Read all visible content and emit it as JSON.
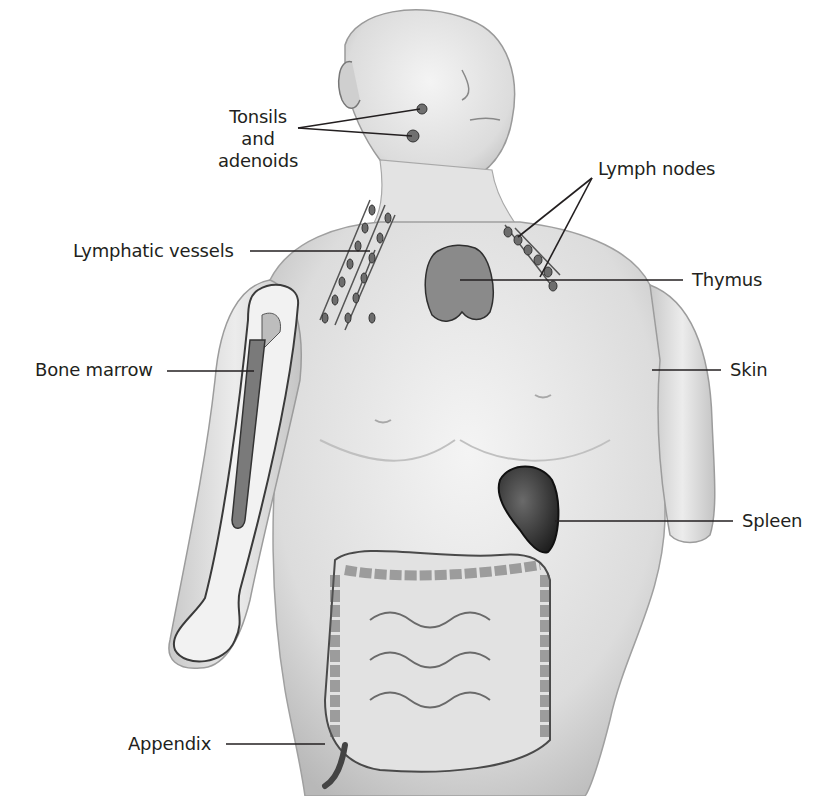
{
  "diagram": {
    "labels": {
      "tonsils": [
        "Tonsils",
        "and",
        "adenoids"
      ],
      "lymph_nodes": "Lymph nodes",
      "lymphatic_vessels": "Lymphatic vessels",
      "thymus": "Thymus",
      "bone_marrow": "Bone marrow",
      "skin": "Skin",
      "spleen": "Spleen",
      "appendix": "Appendix"
    },
    "colors": {
      "background": "#ffffff",
      "text": "#231f20",
      "leader_line": "#231f20",
      "skin_shade": "#d9d9d9",
      "organ_dark": "#3a3a3a"
    }
  }
}
